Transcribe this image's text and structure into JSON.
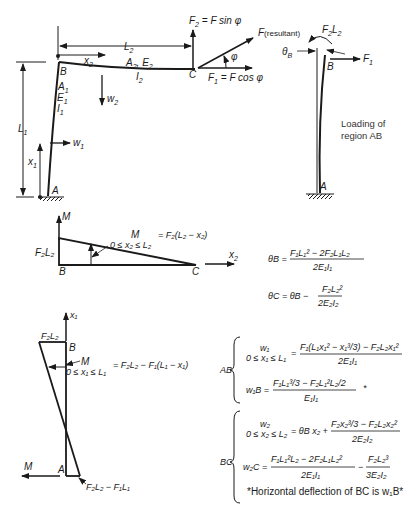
{
  "frame": {
    "points": {
      "A": "A",
      "B": "B",
      "C": "C"
    },
    "column_props": {
      "A": "A",
      "A_sub": "1",
      "E": "E",
      "E_sub": "1",
      "I": "I",
      "I_sub": "1"
    },
    "beam_props": {
      "A": "A",
      "A_sub": "2",
      "sep": ", ",
      "E": "E",
      "E_sub": "2",
      "I": "I",
      "I_sub": "2"
    },
    "dims": {
      "L1": "L",
      "L1_sub": "1",
      "L2": "L",
      "L2_sub": "2",
      "x1": "x",
      "x1_sub": "1",
      "x2": "x",
      "x2_sub": "2"
    },
    "deflections": {
      "w1": "w",
      "w1_sub": "1",
      "w2": "w",
      "w2_sub": "2"
    },
    "forces": {
      "F2_label": "F",
      "F2_sub": "2",
      "F2_rhs": " = F sin φ",
      "F_resultant": "F",
      "F_resultant_suffix": "(resultant)",
      "F1_label": "F",
      "F1_sub": "1",
      "F1_rhs": " = F cos φ",
      "angle": "φ"
    }
  },
  "region_ab": {
    "caption_line1": "Loading of",
    "caption_line2": "region AB",
    "moment_label": "F",
    "moment_sub1": "2",
    "moment_mid": "L",
    "moment_sub2": "2",
    "theta_label": "θ",
    "theta_sub": "B",
    "F1_label": "F",
    "F1_sub": "1",
    "B": "B",
    "A": "A"
  },
  "moment_bc": {
    "axis_M": "M",
    "axis_x2": "x",
    "axis_x2_sub": "2",
    "left_value": "F₂L₂",
    "B": "B",
    "C": "C",
    "M_label": "M",
    "range": "0 ≤ x₂ ≤ L₂",
    "equation": "= F₂(L₂ − x₂)"
  },
  "theta_equations": {
    "theta_B_lhs": "θB =",
    "theta_B_num": "F₁L₁² − 2F₂L₁L₂",
    "theta_B_den": "2E₁I₁",
    "theta_C_lhs": "θC = θB −",
    "theta_C_num": "F₂L₂²",
    "theta_C_den": "2E₂I₂"
  },
  "moment_ab": {
    "axis_x1": "x₁",
    "top_value": "F₂L₂",
    "B": "B",
    "A": "A",
    "M_label": "M",
    "range": "0 ≤ x₁ ≤ L₁",
    "equation": "= F₂L₂ − F₁(L₁ − x₁)",
    "axis_M": "M",
    "bottom_value": "F₂L₂ − F₁L₁"
  },
  "ab_equations": {
    "group": "AB",
    "w1_lhs": "w₁",
    "w1_range": "0 ≤ x₁ ≤ L₁",
    "w1_eq": "=",
    "w1_num": "F₁(L₁x₁² − x₁³/3) − F₂L₂x₁²",
    "w1_den": "2E₁I₁",
    "w1B_lhs": "w₁B =",
    "w1B_num": "F₁L₁³/3 − F₂L₁²L₂/2",
    "w1B_star": "*",
    "w1B_den": "E₁I₁"
  },
  "bc_equations": {
    "group": "BC",
    "w2_lhs": "w₂",
    "w2_range": "0 ≤ x₂ ≤ L₂",
    "w2_eq": "= θB x₂ +",
    "w2_num": "F₂x₂³/3 − F₂L₂x₂²",
    "w2_den": "2E₂I₂",
    "w2C_lhs": "w₂C =",
    "w2C_num1": "F₁L₁²L₂ − 2F₂L₁L₂²",
    "w2C_den1": "2E₁I₁",
    "w2C_minus": "−",
    "w2C_num2": "F₂L₂³",
    "w2C_den2": "3E₂I₂",
    "footnote": "*Horizontal deflection of BC is w₁B*"
  }
}
